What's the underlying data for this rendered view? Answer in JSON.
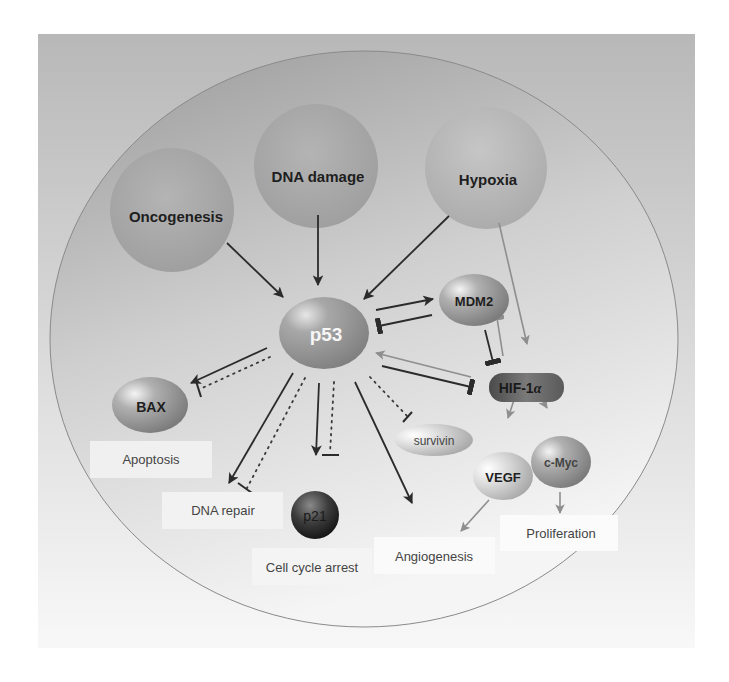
{
  "figure": {
    "colors": {
      "frame_top": "#b9b9b9",
      "frame_bottom": "#f7f7f7",
      "cell_top": "#9c9c9c",
      "cell_bottom": "#f3f3f3",
      "cell_border": "#8a8a8a",
      "arrow_dark": "#2b2b2b",
      "arrow_gray": "#8e8e8e",
      "label_box": "#f2f2f2",
      "text_dark": "#1e1e1e",
      "text_gray": "#444444"
    }
  },
  "stimuli": [
    {
      "id": "oncogenesis",
      "label": "Oncogenesis"
    },
    {
      "id": "dna-damage",
      "label": "DNA damage"
    },
    {
      "id": "hypoxia",
      "label": "Hypoxia"
    }
  ],
  "nodes": {
    "p53": "p53",
    "mdm2": "MDM2",
    "hif1a": "HIF-1",
    "hif1a_suffix": "α",
    "bax": "BAX",
    "p21": "p21",
    "survivin": "survivin",
    "vegf": "VEGF",
    "cmyc": "c-Myc"
  },
  "outcomes": {
    "apoptosis": "Apoptosis",
    "dna_repair": "DNA repair",
    "cell_cycle_arrest": "Cell cycle arrest",
    "angiogenesis": "Angiogenesis",
    "proliferation": "Proliferation"
  },
  "edges": [
    {
      "from": "Oncogenesis",
      "to": "p53",
      "type": "activation"
    },
    {
      "from": "DNA damage",
      "to": "p53",
      "type": "activation"
    },
    {
      "from": "Hypoxia",
      "to": "p53",
      "type": "activation"
    },
    {
      "from": "Hypoxia",
      "to": "HIF-1α",
      "type": "activation",
      "style": "gray"
    },
    {
      "from": "p53",
      "to": "MDM2",
      "type": "activation"
    },
    {
      "from": "MDM2",
      "to": "p53",
      "type": "inhibition"
    },
    {
      "from": "MDM2",
      "to": "HIF-1α",
      "type": "inhibition"
    },
    {
      "from": "HIF-1α",
      "to": "MDM2",
      "type": "inhibition",
      "style": "gray"
    },
    {
      "from": "HIF-1α",
      "to": "p53",
      "type": "activation",
      "style": "gray"
    },
    {
      "from": "p53",
      "to": "HIF-1α",
      "type": "inhibition"
    },
    {
      "from": "p53",
      "to": "BAX",
      "type": "activation"
    },
    {
      "from": "p53",
      "to": "BAX",
      "type": "inhibition",
      "style": "dotted"
    },
    {
      "from": "p53",
      "to": "DNA repair",
      "type": "activation"
    },
    {
      "from": "p53",
      "to": "DNA repair",
      "type": "inhibition",
      "style": "dotted"
    },
    {
      "from": "p53",
      "to": "p21",
      "type": "activation"
    },
    {
      "from": "p53",
      "to": "p21",
      "type": "inhibition",
      "style": "dotted"
    },
    {
      "from": "p53",
      "to": "Angiogenesis",
      "type": "activation"
    },
    {
      "from": "p53",
      "to": "survivin",
      "type": "inhibition",
      "style": "dotted"
    },
    {
      "from": "HIF-1α",
      "to": "VEGF",
      "type": "activation",
      "style": "gray"
    },
    {
      "from": "HIF-1α",
      "to": "c-Myc",
      "type": "activation",
      "style": "gray"
    },
    {
      "from": "VEGF",
      "to": "Angiogenesis",
      "type": "activation",
      "style": "gray"
    },
    {
      "from": "c-Myc",
      "to": "Proliferation",
      "type": "activation",
      "style": "gray"
    }
  ]
}
